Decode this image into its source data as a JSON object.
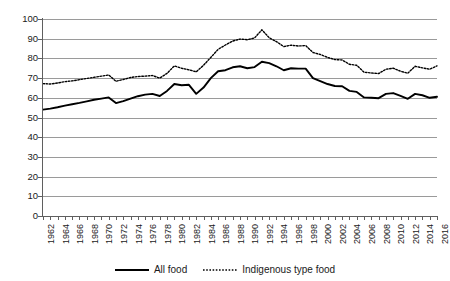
{
  "chart_data": {
    "type": "line",
    "title": "",
    "xlabel": "",
    "ylabel": "",
    "ylim": [
      0,
      100
    ],
    "ytick_step": 10,
    "yticks": [
      0,
      10,
      20,
      30,
      40,
      50,
      60,
      70,
      80,
      90,
      100
    ],
    "grid": true,
    "legend_position": "bottom-center",
    "x": [
      1962,
      1963,
      1964,
      1965,
      1966,
      1967,
      1968,
      1969,
      1970,
      1971,
      1972,
      1973,
      1974,
      1975,
      1976,
      1977,
      1978,
      1979,
      1980,
      1981,
      1982,
      1983,
      1984,
      1985,
      1986,
      1987,
      1988,
      1989,
      1990,
      1991,
      1992,
      1993,
      1994,
      1995,
      1996,
      1997,
      1998,
      1999,
      2000,
      2001,
      2002,
      2003,
      2004,
      2005,
      2006,
      2007,
      2008,
      2009,
      2010,
      2011,
      2012,
      2013,
      2014,
      2015,
      2016
    ],
    "xtick_labels": [
      "1962",
      "1964",
      "1966",
      "1968",
      "1970",
      "1972",
      "1974",
      "1976",
      "1978",
      "1980",
      "1982",
      "1984",
      "1986",
      "1988",
      "1990",
      "1992",
      "1994",
      "1996",
      "1998",
      "2000",
      "2002",
      "2004",
      "2006",
      "2008",
      "2010",
      "2012",
      "2014",
      "2016"
    ],
    "series": [
      {
        "name": "All food",
        "style": "solid",
        "color": "#000000",
        "values": [
          54.0,
          54.5,
          55.2,
          56.0,
          56.7,
          57.4,
          58.2,
          59.0,
          59.6,
          60.2,
          57.3,
          58.3,
          59.6,
          60.8,
          61.6,
          62.0,
          60.9,
          63.5,
          67.0,
          66.4,
          66.6,
          62.0,
          65.2,
          70.0,
          73.5,
          74.0,
          75.5,
          76.0,
          75.0,
          75.6,
          78.3,
          77.6,
          76.0,
          74.0,
          75.0,
          74.8,
          74.8,
          70.0,
          68.5,
          67.0,
          66.0,
          65.9,
          63.5,
          63.0,
          60.2,
          60.0,
          59.8,
          62.0,
          62.4,
          61.0,
          59.5,
          62.0,
          61.3,
          60.0,
          60.5
        ]
      },
      {
        "name": "Indigenous type food",
        "style": "dotted",
        "color": "#000000",
        "values": [
          67.2,
          67.0,
          67.5,
          68.2,
          68.6,
          69.2,
          69.8,
          70.4,
          71.0,
          71.6,
          68.4,
          69.3,
          70.3,
          70.8,
          71.0,
          71.3,
          70.0,
          72.4,
          76.2,
          75.0,
          74.2,
          73.2,
          76.5,
          80.5,
          84.6,
          86.8,
          88.8,
          89.8,
          89.5,
          90.4,
          94.5,
          90.5,
          88.5,
          86.0,
          86.7,
          86.3,
          86.5,
          83.0,
          82.0,
          80.5,
          79.4,
          79.2,
          77.0,
          76.5,
          73.0,
          72.6,
          72.3,
          74.5,
          75.0,
          73.5,
          72.5,
          76.0,
          75.2,
          74.5,
          76.2
        ]
      }
    ]
  },
  "legend": {
    "items": [
      {
        "label": "All food",
        "style": "solid"
      },
      {
        "label": "Indigenous type food",
        "style": "dotted"
      }
    ]
  }
}
